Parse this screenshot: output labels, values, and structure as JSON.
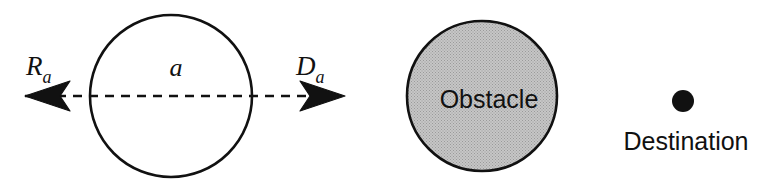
{
  "figure": {
    "background_color": "#ffffff",
    "stroke_color": "#111111",
    "width": 769,
    "height": 182
  },
  "agent": {
    "name": "agent-circle",
    "center_label": "a",
    "fill_color": "#ffffff",
    "stroke_color": "#111111",
    "cx": 171,
    "cy": 96,
    "r": 81
  },
  "direction_line": {
    "name": "direction-axis",
    "y": 96,
    "x_start": 25,
    "x_end": 345,
    "dash_pattern": "9 7",
    "stroke_color": "#111111"
  },
  "arrows": {
    "retreat": {
      "label_main": "R",
      "label_sub": "a",
      "tip_x": 25,
      "tip_y": 96,
      "direction": "left"
    },
    "destination": {
      "label_main": "D",
      "label_sub": "a",
      "tip_x": 345,
      "tip_y": 96,
      "direction": "right"
    }
  },
  "obstacle": {
    "name": "obstacle-circle",
    "label": "Obstacle",
    "fill_color": "#bdbdbd",
    "stroke_color": "#111111",
    "cx": 482,
    "cy": 96,
    "r": 75
  },
  "destination": {
    "name": "destination-point",
    "label": "Destination",
    "fill_color": "#111111",
    "cx": 683,
    "cy": 101,
    "r": 11,
    "label_x": 686,
    "label_y": 150
  }
}
